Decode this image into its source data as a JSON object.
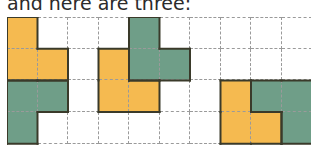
{
  "caption": "and here are three:",
  "colors": {
    "orange": "#f5ba50",
    "green": "#6f9e88",
    "outline": "#3a3a2a",
    "grid_line": "#9a9a9a"
  },
  "grid": {
    "columns": 10,
    "rows": 4,
    "cells": [
      [
        "o",
        "w",
        "w",
        "w",
        "g",
        "w",
        "w",
        "w",
        "w",
        "w"
      ],
      [
        "o",
        "o",
        "w",
        "o",
        "g",
        "g",
        "w",
        "w",
        "w",
        "w"
      ],
      [
        "g",
        "g",
        "w",
        "o",
        "o",
        "w",
        "w",
        "o",
        "g",
        "g"
      ],
      [
        "g",
        "w",
        "w",
        "w",
        "w",
        "w",
        "w",
        "o",
        "o",
        "g"
      ]
    ]
  },
  "pieces": [
    {
      "color": "orange",
      "cells": [
        [
          0,
          0
        ],
        [
          1,
          0
        ],
        [
          1,
          1
        ]
      ]
    },
    {
      "color": "green",
      "cells": [
        [
          2,
          0
        ],
        [
          2,
          1
        ],
        [
          3,
          0
        ]
      ]
    },
    {
      "color": "orange",
      "cells": [
        [
          1,
          3
        ],
        [
          2,
          3
        ],
        [
          2,
          4
        ]
      ]
    },
    {
      "color": "green",
      "cells": [
        [
          0,
          4
        ],
        [
          1,
          4
        ],
        [
          1,
          5
        ]
      ]
    },
    {
      "color": "orange",
      "cells": [
        [
          2,
          7
        ],
        [
          3,
          7
        ],
        [
          3,
          8
        ]
      ]
    },
    {
      "color": "green",
      "cells": [
        [
          2,
          8
        ],
        [
          2,
          9
        ],
        [
          3,
          9
        ]
      ]
    }
  ]
}
